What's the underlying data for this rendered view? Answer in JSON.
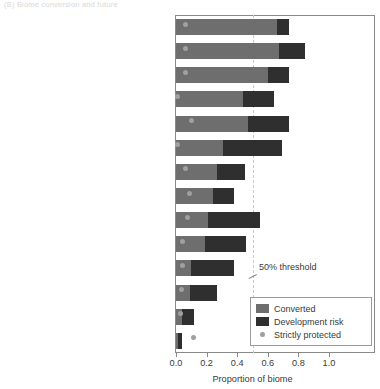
{
  "panel_caption": "(B)  Biome conversion and future",
  "chart_data": {
    "type": "bar",
    "orientation": "horizontal",
    "stacked": true,
    "title": "",
    "xlabel": "Proportion of biome",
    "ylabel": "",
    "xlim": [
      0.0,
      1.1
    ],
    "xticks": [
      "0.0",
      "0.2",
      "0.4",
      "0.6",
      "0.8",
      "1.0"
    ],
    "xtick_values": [
      0.0,
      0.2,
      0.4,
      0.6,
      0.8,
      1.0
    ],
    "grid": false,
    "legend_position": "bottom-right",
    "annotations": [
      {
        "text": "50% threshold",
        "x": 0.5,
        "note": "vertical dashed reference line"
      }
    ],
    "categories": [
      "Temperate broadleaf\nand mixed forests",
      "Tropical and subtropical\ndry broadleaf forests",
      "Mediterranean forests,\nwoodlands, and scrub",
      "Temperate grass lands,\nsavannas, and shrublands",
      "Mangroves",
      "Tropical and subtropical\nconiferous forests",
      "Tropical and subtropical\nmoist broadleaf forests",
      "Temperate coniferous forests",
      "Flooded grasslands and savannas",
      "Tropical and subtropical grasslands,\nsavannas, and shrublands",
      "Montane grasslands\nand shrublands",
      "Deserts and xeric shrublands",
      "Boreal forests/taiga",
      "Tundra"
    ],
    "series": [
      {
        "name": "Converted",
        "color": "#6e6e6e",
        "values": [
          0.66,
          0.67,
          0.6,
          0.44,
          0.47,
          0.31,
          0.27,
          0.24,
          0.21,
          0.19,
          0.1,
          0.09,
          0.04,
          0.012
        ]
      },
      {
        "name": "Development risk",
        "color": "#2f2f2f",
        "values": [
          0.08,
          0.17,
          0.14,
          0.2,
          0.27,
          0.38,
          0.18,
          0.14,
          0.34,
          0.27,
          0.28,
          0.18,
          0.08,
          0.028
        ]
      },
      {
        "name": "Strictly protected",
        "color": "#9f9f9f",
        "marker": "dot",
        "values": [
          0.065,
          0.065,
          0.065,
          0.012,
          0.1,
          0.012,
          0.065,
          0.085,
          0.075,
          0.045,
          0.04,
          0.035,
          0.03,
          0.115
        ]
      }
    ]
  },
  "legend": {
    "items": [
      {
        "label": "Converted",
        "type": "swatch",
        "color": "#6e6e6e"
      },
      {
        "label": "Development risk",
        "type": "swatch",
        "color": "#2f2f2f"
      },
      {
        "label": "Strictly protected",
        "type": "dot",
        "color": "#9f9f9f"
      }
    ]
  }
}
